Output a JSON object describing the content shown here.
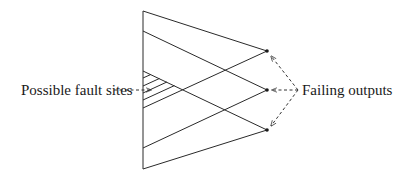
{
  "diagram": {
    "type": "fault-cone-diagram",
    "labels": {
      "fault_sites": "Possible fault sites",
      "failing_outputs": "Failing outputs"
    },
    "colors": {
      "line": "#2a2a2a",
      "dashed": "#555555",
      "background": "#ffffff"
    },
    "left_edge": {
      "x": 143,
      "y_top": 11,
      "y_bottom": 169
    },
    "outputs": [
      {
        "id": "out-top",
        "x": 267,
        "y": 51
      },
      {
        "id": "out-mid",
        "x": 267,
        "y": 90
      },
      {
        "id": "out-bottom",
        "x": 267,
        "y": 130
      }
    ],
    "cone_lines": [
      {
        "from": [
          143,
          11
        ],
        "to": [
          267,
          51
        ]
      },
      {
        "from": [
          143,
          31
        ],
        "to": [
          267,
          90
        ]
      },
      {
        "from": [
          143,
          71
        ],
        "to": [
          267,
          130
        ]
      },
      {
        "from": [
          143,
          108
        ],
        "to": [
          267,
          51
        ]
      },
      {
        "from": [
          143,
          148
        ],
        "to": [
          267,
          90
        ]
      },
      {
        "from": [
          143,
          169
        ],
        "to": [
          267,
          130
        ]
      }
    ],
    "hatch_start_y": [
      78,
      86,
      93,
      100
    ],
    "fault_arrow": {
      "from": [
        114,
        90
      ],
      "to": [
        151,
        90
      ]
    },
    "output_arrows": [
      {
        "from": [
          298,
          90
        ],
        "to": [
          271,
          56
        ]
      },
      {
        "from": [
          298,
          90
        ],
        "to": [
          272,
          90
        ]
      },
      {
        "from": [
          298,
          90
        ],
        "to": [
          271,
          126
        ]
      }
    ]
  }
}
